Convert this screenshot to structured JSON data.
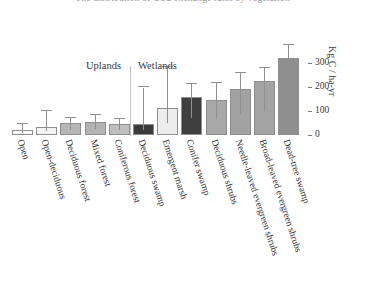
{
  "figure": {
    "title_clipped": "The distribution of CO2 exchange rates by vegetation",
    "group_labels": {
      "uplands": "Uplands",
      "wetlands": "Wetlands"
    }
  },
  "chart_data": {
    "type": "bar",
    "title": "The distribution of CO2 exchange rates by vegetation",
    "xlabel": "",
    "ylabel": "Kg C / ha-yr",
    "ylim": [
      0,
      340
    ],
    "grid": false,
    "legend": false,
    "yticks": [
      0,
      100,
      200,
      300
    ],
    "ytick_labels": [
      "0",
      "100",
      "200",
      "300"
    ],
    "groups": [
      {
        "name": "Uplands",
        "categories": [
          "Open",
          "Open-deciduous",
          "Deciduous forest",
          "Mixed forest",
          "Coniferous forest"
        ]
      },
      {
        "name": "Wetlands",
        "categories": [
          "Deciduous swamp",
          "Emergent marsh",
          "Conifer swamp",
          "Deciduous shrubs",
          "Needle-leaved evergreen shrubs",
          "Broad-leaved evergreen shrubs",
          "Dead-tree swamp"
        ]
      }
    ],
    "categories": [
      "Open",
      "Open-deciduous",
      "Deciduous forest",
      "Mixed forest",
      "Coniferous forest",
      "Deciduous swamp",
      "Emergent marsh",
      "Conifer swamp",
      "Deciduous shrubs",
      "Needle-leaved evergreen shrubs",
      "Broad-leaved evergreen shrubs",
      "Dead-tree swamp"
    ],
    "values": [
      20,
      33,
      50,
      55,
      45,
      46,
      113,
      158,
      146,
      192,
      225,
      320
    ],
    "errors_upper": [
      46,
      100,
      72,
      83,
      66,
      198,
      283,
      212,
      216,
      260,
      280,
      375
    ],
    "bar_colors": [
      "#fbfbfb",
      "#f2f2f2",
      "#b6b6b6",
      "#b3b3b3",
      "#bfbfbf",
      "#3a3a3a",
      "#ededed",
      "#3f3f3f",
      "#a8a8a8",
      "#a2a2a2",
      "#a3a3a3",
      "#8f8f8f"
    ]
  }
}
